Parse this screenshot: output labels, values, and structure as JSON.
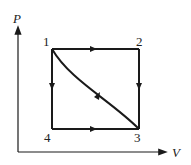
{
  "diagram": {
    "type": "PV cycle diagram",
    "axes": {
      "y_label": "P",
      "x_label": "V"
    },
    "points": [
      {
        "id": "1",
        "label": "1",
        "position": "top-left"
      },
      {
        "id": "2",
        "label": "2",
        "position": "top-right"
      },
      {
        "id": "3",
        "label": "3",
        "position": "bottom-right"
      },
      {
        "id": "4",
        "label": "4",
        "position": "bottom-left"
      }
    ],
    "paths": [
      {
        "from": "1",
        "to": "2",
        "shape": "straight",
        "direction": "right"
      },
      {
        "from": "2",
        "to": "3",
        "shape": "straight",
        "direction": "down"
      },
      {
        "from": "3",
        "to": "1",
        "shape": "curve",
        "direction": "up-left"
      },
      {
        "from": "1",
        "to": "4",
        "shape": "straight",
        "direction": "down"
      },
      {
        "from": "4",
        "to": "3",
        "shape": "straight",
        "direction": "right"
      }
    ],
    "colors": {
      "line": "#1a1a1a",
      "background": "#ffffff"
    }
  }
}
